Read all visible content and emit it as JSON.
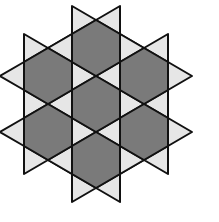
{
  "diagram": {
    "colors": {
      "hexagon": "#7a7a7a",
      "triangle": "#e6e6e6",
      "stroke": "#111111",
      "background": "#ffffff"
    },
    "hexagons": [
      {
        "cx": 96,
        "cy": 48
      },
      {
        "cx": 48,
        "cy": 76
      },
      {
        "cx": 144,
        "cy": 76
      },
      {
        "cx": 96,
        "cy": 104
      },
      {
        "cx": 48,
        "cy": 132
      },
      {
        "cx": 144,
        "cy": 132
      },
      {
        "cx": 96,
        "cy": 160
      }
    ],
    "hex_half_width": 24,
    "hex_half_height": 28
  }
}
